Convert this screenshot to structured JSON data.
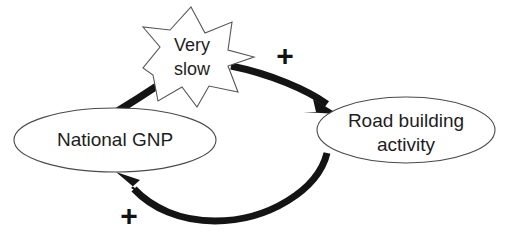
{
  "diagram": {
    "type": "causal-loop-diagram",
    "background_color": "#ffffff",
    "nodes": [
      {
        "id": "national-gnp",
        "label": "National GNP",
        "shape": "ellipse",
        "cx": 115,
        "cy": 140,
        "rx": 101,
        "ry": 32,
        "stroke_color": "#4a4a4a",
        "fill_color": "#ffffff"
      },
      {
        "id": "road-building-activity",
        "label_line_1": "Road building",
        "label_line_2": "activity",
        "shape": "ellipse",
        "cx": 406,
        "cy": 130,
        "rx": 89,
        "ry": 33,
        "stroke_color": "#4a4a4a",
        "fill_color": "#ffffff"
      }
    ],
    "delay_marker": {
      "id": "very-slow-burst",
      "label_line_1": "Very",
      "label_line_2": "slow",
      "shape": "starburst",
      "points": 8,
      "cx": 191,
      "cy": 57,
      "outer_radius": 50,
      "inner_radius": 30,
      "stroke_color": "#55555a",
      "fill_color": "#ffffff"
    },
    "links": [
      {
        "id": "gnp-to-road",
        "from": "national-gnp",
        "to": "road-building-activity",
        "polarity": "+",
        "passes_through": "very-slow-burst",
        "stroke_color": "#141414",
        "arrowhead": "filled-triangle"
      },
      {
        "id": "road-to-gnp",
        "from": "road-building-activity",
        "to": "national-gnp",
        "polarity": "+",
        "stroke_color": "#141414",
        "arrowhead": "filled-triangle"
      }
    ],
    "polarity_markers": [
      {
        "id": "polarity-top",
        "symbol": "+",
        "x": 285,
        "y": 58
      },
      {
        "id": "polarity-bottom",
        "symbol": "+",
        "x": 129,
        "y": 218
      }
    ]
  }
}
